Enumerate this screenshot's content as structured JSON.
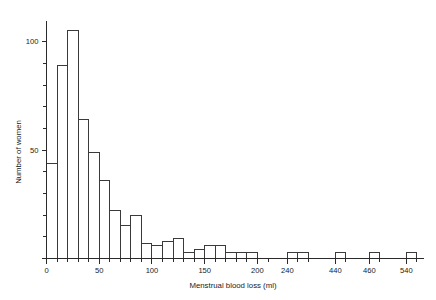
{
  "chart_data": {
    "type": "bar",
    "title": "",
    "subtitle": "",
    "xlabel": "Menstrual blood loss (ml)",
    "ylabel": "Number of women",
    "grid": false,
    "legend": null,
    "xlim": [
      0,
      560
    ],
    "ylim": [
      0,
      110
    ],
    "y_ticks_major": [
      0,
      50,
      100
    ],
    "y_tick_labels": [
      "0",
      "50",
      "100"
    ],
    "y_tick_minor_step": 10,
    "x_tick_labels": [
      "0",
      "50",
      "100",
      "150",
      "200",
      "240",
      "440",
      "460",
      "540"
    ],
    "x_tick_values": [
      0,
      50,
      100,
      150,
      200,
      240,
      440,
      460,
      540
    ],
    "x_tick_minor_step": 10,
    "axis_breaks": [
      {
        "after": 210,
        "before": 235
      },
      {
        "after": 255,
        "before": 425
      },
      {
        "after": 450,
        "before": 455
      },
      {
        "after": 470,
        "before": 530
      }
    ],
    "bin_width": 10,
    "categories": [
      "0-10",
      "10-20",
      "20-30",
      "30-40",
      "40-50",
      "50-60",
      "60-70",
      "70-80",
      "80-90",
      "90-100",
      "100-110",
      "110-120",
      "120-130",
      "130-140",
      "140-150",
      "150-160",
      "160-170",
      "170-180",
      "180-190",
      "190-200",
      "240-250",
      "250-260",
      "440-450",
      "460-470",
      "540-550"
    ],
    "bins": [
      {
        "x0": 0,
        "x1": 10,
        "value": 44
      },
      {
        "x0": 10,
        "x1": 20,
        "value": 89
      },
      {
        "x0": 20,
        "x1": 30,
        "value": 105
      },
      {
        "x0": 30,
        "x1": 40,
        "value": 64
      },
      {
        "x0": 40,
        "x1": 50,
        "value": 49
      },
      {
        "x0": 50,
        "x1": 60,
        "value": 36
      },
      {
        "x0": 60,
        "x1": 70,
        "value": 22
      },
      {
        "x0": 70,
        "x1": 80,
        "value": 15
      },
      {
        "x0": 80,
        "x1": 90,
        "value": 20
      },
      {
        "x0": 90,
        "x1": 100,
        "value": 7
      },
      {
        "x0": 100,
        "x1": 110,
        "value": 6
      },
      {
        "x0": 110,
        "x1": 120,
        "value": 8
      },
      {
        "x0": 120,
        "x1": 130,
        "value": 9
      },
      {
        "x0": 130,
        "x1": 140,
        "value": 3
      },
      {
        "x0": 140,
        "x1": 150,
        "value": 4
      },
      {
        "x0": 150,
        "x1": 160,
        "value": 6
      },
      {
        "x0": 160,
        "x1": 170,
        "value": 6
      },
      {
        "x0": 170,
        "x1": 180,
        "value": 3
      },
      {
        "x0": 180,
        "x1": 190,
        "value": 3
      },
      {
        "x0": 190,
        "x1": 200,
        "value": 3
      },
      {
        "x0": 240,
        "x1": 250,
        "value": 3
      },
      {
        "x0": 250,
        "x1": 260,
        "value": 3
      },
      {
        "x0": 440,
        "x1": 450,
        "value": 3
      },
      {
        "x0": 460,
        "x1": 470,
        "value": 3
      },
      {
        "x0": 540,
        "x1": 550,
        "value": 3
      }
    ],
    "values": [
      44,
      89,
      105,
      64,
      49,
      36,
      22,
      15,
      20,
      7,
      6,
      8,
      9,
      3,
      4,
      6,
      6,
      3,
      3,
      3,
      3,
      3,
      3,
      3,
      3
    ],
    "colors": {
      "bar_stroke": "#3a3a3a",
      "bar_fill": "none",
      "axis": "#2b2b2b",
      "text": "#1a1a1a",
      "background": "#ffffff"
    }
  }
}
